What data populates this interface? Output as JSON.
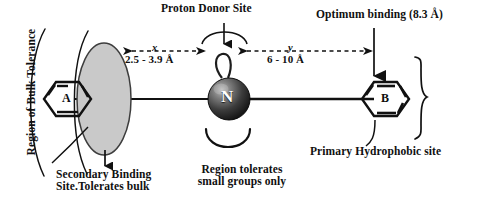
{
  "diagram": {
    "labels": {
      "region_of_bulk_tolerance": "Region of Bulk Tolerance",
      "proton_donor_site": "Proton Donor Site",
      "optimum_binding": "Optimum binding (8.3 Å)",
      "secondary_binding": "Secondary Binding\nSite.Tolerates bulk",
      "secondary_binding_line1": "Secondary Binding",
      "secondary_binding_line2": "Site.Tolerates bulk",
      "region_tolerates_small": "Region tolerates small groups only",
      "region_tolerates_line1": "Region tolerates",
      "region_tolerates_line2": "small groups only",
      "primary_hydrophobic_site": "Primary Hydrophobic site"
    },
    "distances": {
      "x_letter": "x",
      "x_value": "2.5 - 3.9 Å",
      "y_letter": "y",
      "y_value": "6 - 10 Å"
    },
    "nodes": {
      "ring_a_letter": "A",
      "ring_b_letter": "B",
      "center_atom": "N"
    },
    "colors": {
      "ink": "#101010",
      "ellipse_fill": "#c9c9c9",
      "ellipse_stroke": "#3a3a3a",
      "sphere_dark": "#1a1a1a",
      "sphere_light": "#8f8f8f",
      "background": "#ffffff"
    }
  }
}
